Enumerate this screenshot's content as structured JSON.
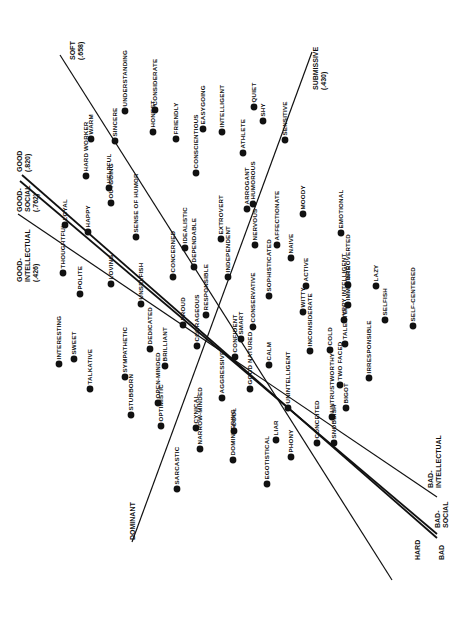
{
  "chart_data": {
    "type": "scatter",
    "title": "",
    "orientation_note": "page rotated 90deg; labels read bottom-to-top",
    "axes": [
      {
        "name": "soft-hard",
        "label_start": "SOFT",
        "value_start": "(.658)",
        "label_end": "HARD",
        "start": [
          60,
          55
        ],
        "end": [
          392,
          580
        ],
        "width": 1.2
      },
      {
        "name": "dominant-submissive",
        "label_start": "DOMINANT",
        "value_start": "",
        "label_end": "SUBMISSIVE",
        "value_end": "(.430)",
        "start": [
          132,
          542
        ],
        "end": [
          312,
          52
        ],
        "width": 1.2
      },
      {
        "name": "good-bad-intellectual",
        "label_start": "GOOD-INTELLECTUAL",
        "value_start": "(.426)",
        "label_end": "BAD-INTELLECTUAL",
        "start": [
          18,
          214
        ],
        "end": [
          437,
          497
        ],
        "width": 1.2
      },
      {
        "name": "good-bad-social",
        "label_start": "GOOD-SOCIAL",
        "value_start": "(.762)",
        "label_end": "BAD-SOCIAL",
        "start": [
          20,
          181
        ],
        "end": [
          437,
          534
        ],
        "width": 1.8
      },
      {
        "name": "good-bad",
        "label_start": "GOOD",
        "value_start": "(.820)",
        "label_end": "BAD",
        "start": [
          22,
          175
        ],
        "end": [
          437,
          538
        ],
        "width": 1.8
      }
    ],
    "points": [
      {
        "label": "SOFT",
        "x": 0,
        "y": 0
      },
      {
        "label": "UNDERSTANDING",
        "x": 125,
        "y": 111
      },
      {
        "label": "WARM",
        "x": 91,
        "y": 139
      },
      {
        "label": "SINCERE",
        "x": 115,
        "y": 141
      },
      {
        "label": "HARD WORKER",
        "x": 86,
        "y": 176
      },
      {
        "label": "HELPFUL",
        "x": 109,
        "y": 188
      },
      {
        "label": "OUTGOING",
        "x": 111,
        "y": 203
      },
      {
        "label": "CONSIDERATE",
        "x": 155,
        "y": 110
      },
      {
        "label": "HONEST",
        "x": 153,
        "y": 132
      },
      {
        "label": "FRIENDLY",
        "x": 176,
        "y": 139
      },
      {
        "label": "CONSCIENTIOUS",
        "x": 196,
        "y": 173
      },
      {
        "label": "EASYGOING",
        "x": 203,
        "y": 129
      },
      {
        "label": "INTELLIGENT",
        "x": 222,
        "y": 132
      },
      {
        "label": "ATHLETE",
        "x": 243,
        "y": 153
      },
      {
        "label": "QUIET",
        "x": 254,
        "y": 107
      },
      {
        "label": "SHY",
        "x": 263,
        "y": 121
      },
      {
        "label": "SENSITIVE",
        "x": 285,
        "y": 140
      },
      {
        "label": "LOYAL",
        "x": 65,
        "y": 225
      },
      {
        "label": "HAPPY",
        "x": 88,
        "y": 232
      },
      {
        "label": "SENSE OF HUMOR",
        "x": 136,
        "y": 237
      },
      {
        "label": "THOUGHTFUL",
        "x": 63,
        "y": 273
      },
      {
        "label": "POLITE",
        "x": 80,
        "y": 294
      },
      {
        "label": "LOVING",
        "x": 111,
        "y": 284
      },
      {
        "label": "IDEALISTIC",
        "x": 185,
        "y": 248
      },
      {
        "label": "DEPENDABLE",
        "x": 194,
        "y": 267
      },
      {
        "label": "CONCERNED",
        "x": 173,
        "y": 277
      },
      {
        "label": "EXTROVERT",
        "x": 221,
        "y": 239
      },
      {
        "label": "ARROGANT",
        "x": 247,
        "y": 209
      },
      {
        "label": "HUMOROUS",
        "x": 253,
        "y": 204
      },
      {
        "label": "NERVOUS",
        "x": 255,
        "y": 245
      },
      {
        "label": "AFFECTIONATE",
        "x": 277,
        "y": 245
      },
      {
        "label": "NAIVE",
        "x": 291,
        "y": 258
      },
      {
        "label": "MOODY",
        "x": 303,
        "y": 214
      },
      {
        "label": "EMOTIONAL",
        "x": 341,
        "y": 233
      },
      {
        "label": "INDEPENDENT",
        "x": 228,
        "y": 277
      },
      {
        "label": "RESPONSIBLE",
        "x": 206,
        "y": 315
      },
      {
        "label": "SOPHISTICATED",
        "x": 269,
        "y": 296
      },
      {
        "label": "ACTIVE",
        "x": 306,
        "y": 286
      },
      {
        "label": "INTROVERTED",
        "x": 348,
        "y": 285
      },
      {
        "label": "LAZY",
        "x": 376,
        "y": 286
      },
      {
        "label": "UNSELFISH",
        "x": 141,
        "y": 304
      },
      {
        "label": "PROUD",
        "x": 183,
        "y": 325
      },
      {
        "label": "COURAGEOUS",
        "x": 197,
        "y": 346
      },
      {
        "label": "CONFIDENT",
        "x": 235,
        "y": 357
      },
      {
        "label": "SMART",
        "x": 241,
        "y": 339
      },
      {
        "label": "CONSERVATIVE",
        "x": 253,
        "y": 327
      },
      {
        "label": "WITTY",
        "x": 303,
        "y": 312
      },
      {
        "label": "INCONSIDERATE",
        "x": 310,
        "y": 351
      },
      {
        "label": "COLD",
        "x": 330,
        "y": 350
      },
      {
        "label": "VERY INTELLIGENT",
        "x": 344,
        "y": 320
      },
      {
        "label": "IMMATURE",
        "x": 348,
        "y": 305
      },
      {
        "label": "TALENTED",
        "x": 345,
        "y": 344
      },
      {
        "label": "SELFISH",
        "x": 385,
        "y": 320
      },
      {
        "label": "SELF-CENTERED",
        "x": 413,
        "y": 326
      },
      {
        "label": "IRRESPONSIBLE",
        "x": 369,
        "y": 378
      },
      {
        "label": "INTERESTING",
        "x": 59,
        "y": 364
      },
      {
        "label": "SWEET",
        "x": 74,
        "y": 359
      },
      {
        "label": "TALKATIVE",
        "x": 90,
        "y": 389
      },
      {
        "label": "SYMPATHETIC",
        "x": 125,
        "y": 377
      },
      {
        "label": "DEDICATED",
        "x": 150,
        "y": 349
      },
      {
        "label": "BRILLIANT",
        "x": 165,
        "y": 366
      },
      {
        "label": "STUBBORN",
        "x": 131,
        "y": 415
      },
      {
        "label": "OPEN-MINDED",
        "x": 158,
        "y": 403
      },
      {
        "label": "OPTIMISTIC",
        "x": 161,
        "y": 426
      },
      {
        "label": "AGGRESSIVE",
        "x": 222,
        "y": 398
      },
      {
        "label": "GOOD NATURED",
        "x": 250,
        "y": 389
      },
      {
        "label": "CALM",
        "x": 269,
        "y": 365
      },
      {
        "label": "UNINTELLIGENT",
        "x": 288,
        "y": 408
      },
      {
        "label": "UNTRUSTWORTHY",
        "x": 332,
        "y": 417
      },
      {
        "label": "TWO FACED",
        "x": 340,
        "y": 385
      },
      {
        "label": "BIGOT",
        "x": 346,
        "y": 408
      },
      {
        "label": "CONCEITED",
        "x": 317,
        "y": 443
      },
      {
        "label": "SNOBBISH",
        "x": 334,
        "y": 443
      },
      {
        "label": "PHONY",
        "x": 291,
        "y": 457
      },
      {
        "label": "CYNICAL",
        "x": 196,
        "y": 428
      },
      {
        "label": "NARROW-MINDED",
        "x": 200,
        "y": 449
      },
      {
        "label": "COOL",
        "x": 234,
        "y": 431
      },
      {
        "label": "DOMINEERING",
        "x": 233,
        "y": 460
      },
      {
        "label": "LIAR",
        "x": 276,
        "y": 440
      },
      {
        "label": "EGOTISTICAL",
        "x": 267,
        "y": 484
      },
      {
        "label": "SARCASTIC",
        "x": 177,
        "y": 489
      }
    ],
    "legend": [],
    "grid": false
  }
}
